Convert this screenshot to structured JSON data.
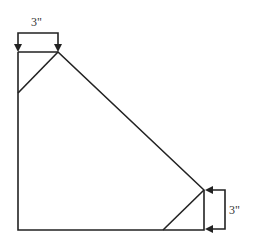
{
  "diagram": {
    "labels": {
      "top_dimension": "3\"",
      "right_dimension": "3\""
    },
    "colors": {
      "stroke": "#222222",
      "background": "#ffffff"
    }
  }
}
